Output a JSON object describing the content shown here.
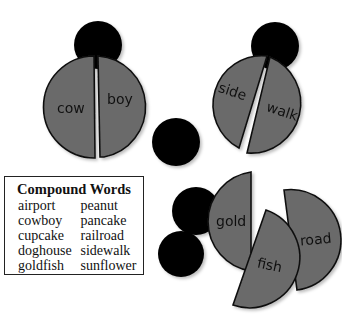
{
  "ladybugs": [
    {
      "parts": [
        "cow",
        "boy"
      ]
    },
    {
      "parts": [
        "side",
        "walk"
      ]
    }
  ],
  "loose_pieces": [
    "gold",
    "fish",
    "road"
  ],
  "word_box": {
    "title": "Compound Words",
    "columns": [
      [
        "airport",
        "cowboy",
        "cupcake",
        "doghouse",
        "goldfish"
      ],
      [
        "peanut",
        "pancake",
        "railroad",
        "sidewalk",
        "sunflower"
      ]
    ]
  }
}
